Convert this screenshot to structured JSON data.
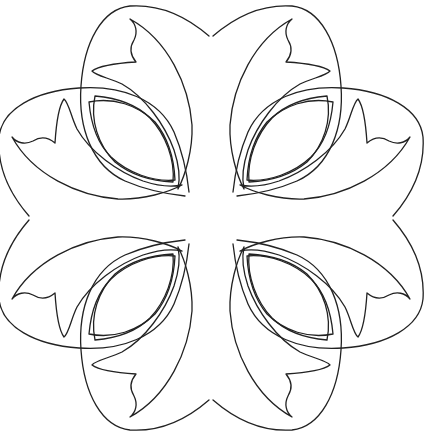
{
  "image": {
    "title": "Floral four-fold symmetric coloring page outline",
    "background_color": "#ffffff",
    "stroke_color": "#222222",
    "symmetry": "4-fold (mirror horizontal, vertical, diagonal)",
    "motif_count": 8,
    "motifs": [
      {
        "name": "top-left-vertical-petal"
      },
      {
        "name": "top-left-horizontal-petal"
      },
      {
        "name": "top-right-vertical-petal"
      },
      {
        "name": "top-right-horizontal-petal"
      },
      {
        "name": "bottom-left-vertical-petal"
      },
      {
        "name": "bottom-left-horizontal-petal"
      },
      {
        "name": "bottom-right-vertical-petal"
      },
      {
        "name": "bottom-right-horizontal-petal"
      }
    ]
  }
}
